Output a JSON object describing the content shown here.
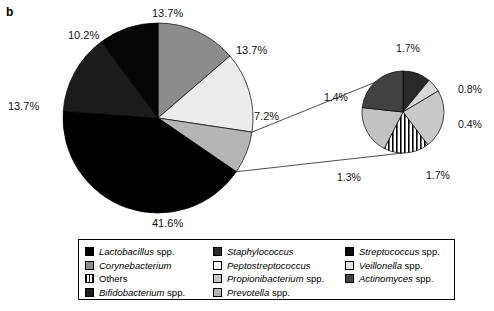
{
  "figure": {
    "panel_letter": "b"
  },
  "chart_data": {
    "type": "pie",
    "title": "",
    "subtitle": "",
    "xlabel": "",
    "ylabel": "",
    "grid": false,
    "legend_position": "bottom",
    "main_pie": {
      "name": "main-pie",
      "center": [
        158,
        118
      ],
      "radius": 95,
      "start_angle_deg": -90,
      "slices": [
        {
          "label": "Corynebacterium",
          "value": 13.7,
          "display": "13.7%",
          "color": "#8c8c8c",
          "pattern": "solid"
        },
        {
          "label": "Peptostreptococcus",
          "value": 13.7,
          "display": "13.7%",
          "color": "#ececec",
          "pattern": "solid"
        },
        {
          "label": "Prevotella spp.",
          "value": 7.2,
          "display": "7.2%",
          "color": "#b5b5b5",
          "pattern": "solid"
        },
        {
          "label": "Lactobacillus spp.",
          "value": 41.6,
          "display": "41.6%",
          "color": "#000000",
          "pattern": "solid"
        },
        {
          "label": "Bifidobacterium spp.",
          "value": 13.7,
          "display": "13.7%",
          "color": "#1c1c1c",
          "pattern": "solid"
        },
        {
          "label": "Staphylococcus",
          "value": 10.2,
          "display": "10.2%",
          "color": "#060606",
          "pattern": "solid"
        }
      ]
    },
    "sub_pie": {
      "name": "exploded-sub-pie",
      "center": [
        403,
        112
      ],
      "radius": 41,
      "start_angle_deg": -90,
      "exploded_from": "Prevotella spp. (7.2%) sector of main pie",
      "slices": [
        {
          "label": "Streptococcus spp.",
          "value": 0.8,
          "display": "0.8%",
          "color": "#2a2a2a",
          "pattern": "solid"
        },
        {
          "label": "Veillonella spp.",
          "value": 0.4,
          "display": "0.4%",
          "color": "#d8d8d8",
          "pattern": "solid"
        },
        {
          "label": "Propionibacterium spp.",
          "value": 1.7,
          "display": "1.7%",
          "color": "#c9c9c9",
          "pattern": "solid"
        },
        {
          "label": "Others",
          "value": 1.3,
          "display": "1.3%",
          "color": "#ffffff",
          "pattern": "vertical-stripes"
        },
        {
          "label": "Prevotella spp.",
          "value": 1.4,
          "display": "1.4%",
          "color": "#c2c2c2",
          "pattern": "solid"
        },
        {
          "label": "Actinomyces spp.",
          "value": 1.7,
          "display": "1.7%",
          "color": "#424242",
          "pattern": "solid"
        }
      ]
    },
    "labels": [
      {
        "name": "main-label-corynebacterium",
        "text": "13.7%",
        "x": 152,
        "y": 8,
        "align": "left"
      },
      {
        "name": "main-label-staphylococcus",
        "text": "10.2%",
        "x": 68,
        "y": 30,
        "align": "left"
      },
      {
        "name": "main-label-peptostreptococcus",
        "text": "13.7%",
        "x": 236,
        "y": 45,
        "align": "left"
      },
      {
        "name": "main-label-bifidobacterium",
        "text": "13.7%",
        "x": 8,
        "y": 101,
        "align": "left"
      },
      {
        "name": "main-label-prevotella",
        "text": "7.2%",
        "x": 254,
        "y": 111,
        "align": "left"
      },
      {
        "name": "main-label-lactobacillus",
        "text": "41.6%",
        "x": 152,
        "y": 218,
        "align": "left"
      },
      {
        "name": "sub-label-actinomyces",
        "text": "1.7%",
        "x": 396,
        "y": 43,
        "align": "left"
      },
      {
        "name": "sub-label-streptococcus",
        "text": "0.8%",
        "x": 458,
        "y": 84,
        "align": "left"
      },
      {
        "name": "sub-label-veillonella",
        "text": "0.4%",
        "x": 458,
        "y": 119,
        "align": "left"
      },
      {
        "name": "sub-label-propionibacterium",
        "text": "1.7%",
        "x": 426,
        "y": 170,
        "align": "left"
      },
      {
        "name": "sub-label-others",
        "text": "1.3%",
        "x": 337,
        "y": 172,
        "align": "left"
      },
      {
        "name": "sub-label-prevotella-sub",
        "text": "1.4%",
        "x": 324,
        "y": 92,
        "align": "left"
      }
    ]
  },
  "legend": {
    "name": "chart-legend",
    "columns": [
      [
        {
          "label_italic": "Lactobacillus",
          "label_rest": " spp.",
          "color": "#000000",
          "pattern": "solid"
        },
        {
          "label_italic": "Corynebacterium",
          "label_rest": "",
          "color": "#8c8c8c",
          "pattern": "solid"
        },
        {
          "label_italic": "",
          "label_rest": "Others",
          "color": "#ffffff",
          "pattern": "vertical-stripes"
        },
        {
          "label_italic": "Bifidobacterium",
          "label_rest": " spp.",
          "color": "#1c1c1c",
          "pattern": "solid"
        }
      ],
      [
        {
          "label_italic": "Staphylococcus",
          "label_rest": "",
          "color": "#2a2a2a",
          "pattern": "solid"
        },
        {
          "label_italic": "Peptostreptococcus",
          "label_rest": "",
          "color": "#f4f4f4",
          "pattern": "solid"
        },
        {
          "label_italic": "Propionibacterium",
          "label_rest": " spp.",
          "color": "#c9c9c9",
          "pattern": "solid"
        },
        {
          "label_italic": "Prevotella",
          "label_rest": " spp.",
          "color": "#b5b5b5",
          "pattern": "solid"
        }
      ],
      [
        {
          "label_italic": "Streptococcus",
          "label_rest": " spp.",
          "color": "#0a0a0a",
          "pattern": "solid"
        },
        {
          "label_italic": "Veillonella",
          "label_rest": " spp.",
          "color": "#e2e2e2",
          "pattern": "solid"
        },
        {
          "label_italic": "Actinomyces",
          "label_rest": " spp.",
          "color": "#424242",
          "pattern": "solid"
        }
      ]
    ]
  }
}
